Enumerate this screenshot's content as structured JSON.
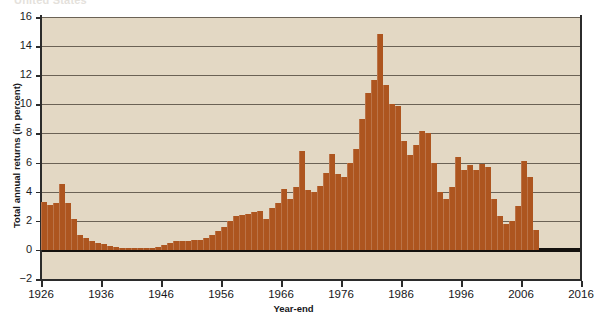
{
  "figure": {
    "clipped_heading": "United States",
    "background_color": "#e3d8c4",
    "bar_color": "#ad551f",
    "axis_color": "#2b2b2b",
    "grid_color": "#6b6255"
  },
  "chart_data": {
    "type": "bar",
    "title": "",
    "xlabel": "Year-end",
    "ylabel": "Total annual returns (in percent)",
    "ylim": [
      -2,
      16
    ],
    "xlim": [
      1926,
      2016
    ],
    "grid": true,
    "legend": "none",
    "ytick_labels": [
      "-2",
      "0",
      "2",
      "4",
      "6",
      "8",
      "10",
      "12",
      "14",
      "16"
    ],
    "ytick_values": [
      -2,
      0,
      2,
      4,
      6,
      8,
      10,
      12,
      14,
      16
    ],
    "xtick_labels": [
      "1926",
      "1936",
      "1946",
      "1956",
      "1966",
      "1976",
      "1986",
      "1996",
      "2006",
      "2016"
    ],
    "xtick_values": [
      1926,
      1936,
      1946,
      1956,
      1966,
      1976,
      1986,
      1996,
      2006,
      2016
    ],
    "x": [
      1926,
      1927,
      1928,
      1929,
      1930,
      1931,
      1932,
      1933,
      1934,
      1935,
      1936,
      1937,
      1938,
      1939,
      1940,
      1941,
      1942,
      1943,
      1944,
      1945,
      1946,
      1947,
      1948,
      1949,
      1950,
      1951,
      1952,
      1953,
      1954,
      1955,
      1956,
      1957,
      1958,
      1959,
      1960,
      1961,
      1962,
      1963,
      1964,
      1965,
      1966,
      1967,
      1968,
      1969,
      1970,
      1971,
      1972,
      1973,
      1974,
      1975,
      1976,
      1977,
      1978,
      1979,
      1980,
      1981,
      1982,
      1983,
      1984,
      1985,
      1986,
      1987,
      1988,
      1989,
      1990,
      1991,
      1992,
      1993,
      1994,
      1995,
      1996,
      1997,
      1998,
      1999,
      2000,
      2001,
      2002,
      2003,
      2004,
      2005,
      2006,
      2007,
      2008
    ],
    "values": [
      3.3,
      3.1,
      3.2,
      4.5,
      3.2,
      2.1,
      1.0,
      0.8,
      0.6,
      0.5,
      0.4,
      0.3,
      0.2,
      0.15,
      0.1,
      0.1,
      0.1,
      0.1,
      0.15,
      0.2,
      0.35,
      0.5,
      0.6,
      0.6,
      0.6,
      0.65,
      0.7,
      0.8,
      1.0,
      1.3,
      1.6,
      2.0,
      2.3,
      2.4,
      2.5,
      2.6,
      2.7,
      2.1,
      2.9,
      3.2,
      4.2,
      3.5,
      4.3,
      6.8,
      4.1,
      4.0,
      4.4,
      5.3,
      6.6,
      5.2,
      5.0,
      6.0,
      6.9,
      9.0,
      10.8,
      11.7,
      14.8,
      11.3,
      10.0,
      9.9,
      7.5,
      6.5,
      7.2,
      8.2,
      8.0,
      6.0,
      4.0,
      3.5,
      4.3,
      6.4,
      5.5,
      5.8,
      5.5,
      5.9,
      5.7,
      3.5,
      2.3,
      1.8,
      2.0,
      3.0,
      6.1,
      5.0,
      1.4
    ]
  }
}
